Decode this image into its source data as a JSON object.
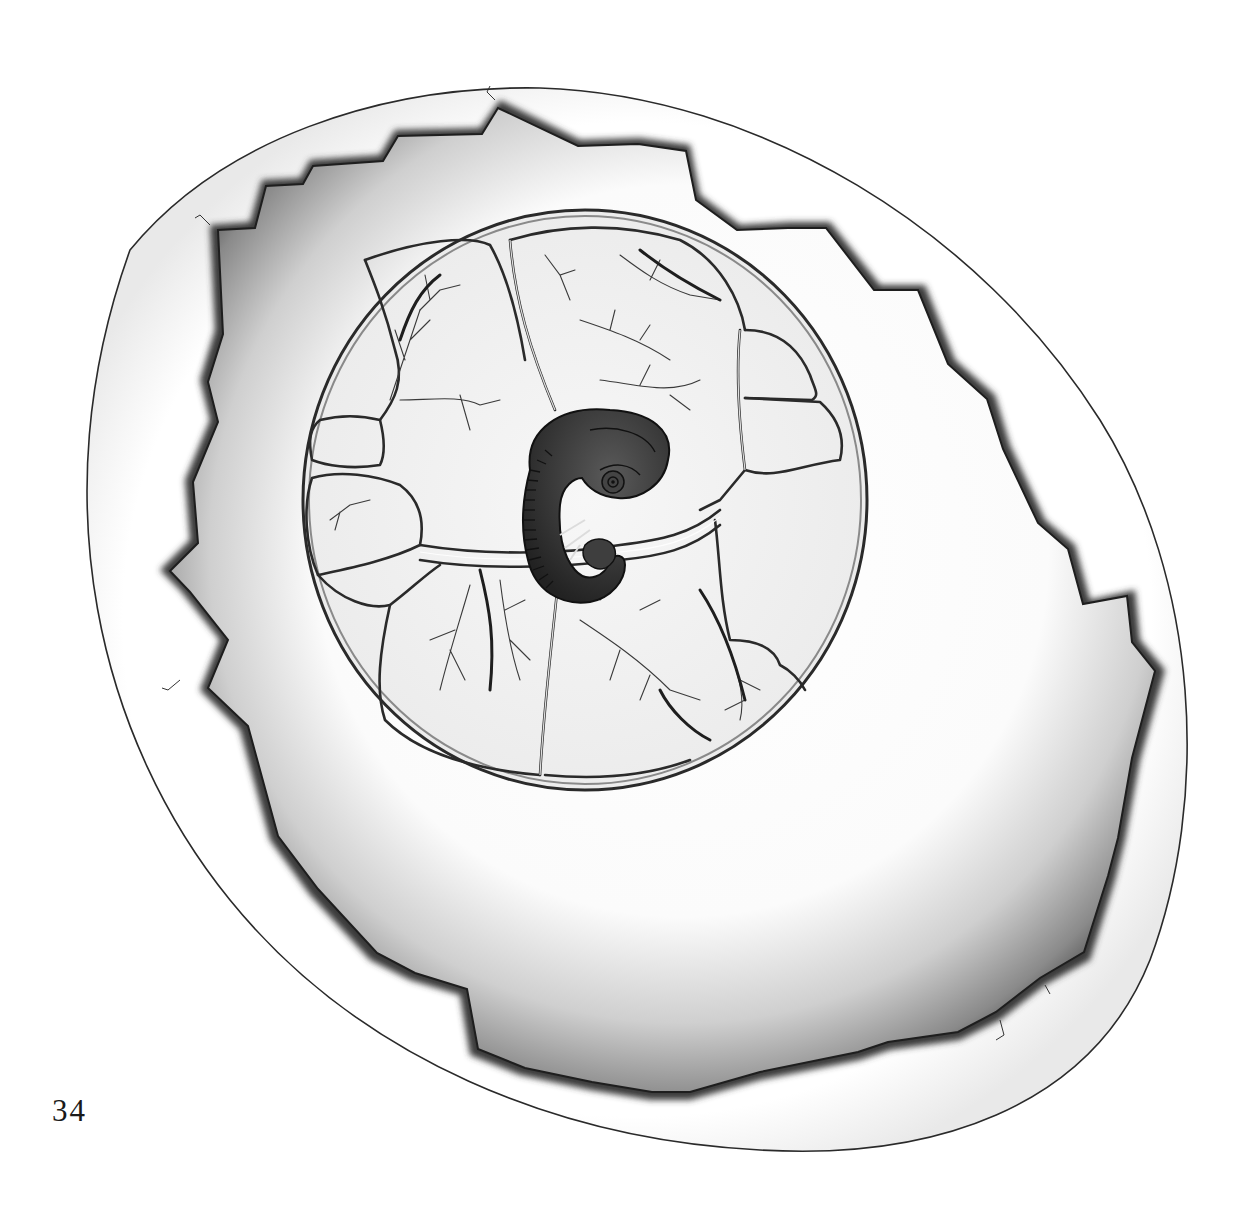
{
  "figure": {
    "parts": [
      {
        "name": "egg-shell",
        "label": "Egg shell (outer)"
      },
      {
        "name": "shell-opening",
        "label": "Broken shell window"
      },
      {
        "name": "yolk-surface",
        "label": "Yolk / albumen surface"
      },
      {
        "name": "area-vasculosa",
        "label": "Vitelline blood vessel network"
      },
      {
        "name": "embryo",
        "label": "Embryo"
      }
    ],
    "colors": {
      "paper": "#ffffff",
      "ink": "#1a1a1a",
      "shell_shadow": "#5a5a5a",
      "yolk": "#f4f4f4",
      "embryo": "#3a3a3a"
    }
  },
  "page": {
    "number": "34"
  }
}
